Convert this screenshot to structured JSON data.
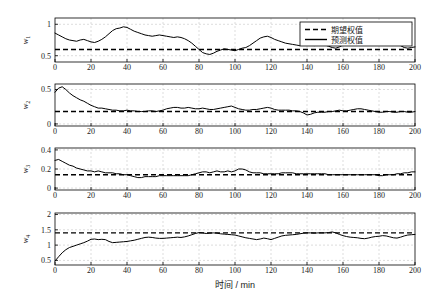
{
  "chart_data": {
    "type": "line",
    "title": "",
    "xlabel": "时间 / min",
    "xlim": [
      0,
      200
    ],
    "xticks": [
      0,
      20,
      40,
      60,
      80,
      100,
      120,
      140,
      160,
      180,
      200
    ],
    "grid": true,
    "legend_position": "top-right",
    "legend": [
      {
        "label": "期望权值",
        "style": "dashed"
      },
      {
        "label": "预测权值",
        "style": "solid"
      }
    ],
    "panels": [
      {
        "ylabel": "w1",
        "ylabel_base": "w",
        "ylabel_sub": "1",
        "ylim": [
          0.4,
          1.1
        ],
        "yticks": [
          0.5,
          1
        ],
        "ytick_labels": [
          "0.5",
          "1"
        ],
        "expected_value": 0.6,
        "series": [
          {
            "name": "预测权值",
            "x": [
              0,
              2,
              4,
              6,
              8,
              10,
              12,
              14,
              16,
              18,
              20,
              22,
              24,
              26,
              28,
              30,
              32,
              34,
              36,
              38,
              40,
              42,
              44,
              46,
              48,
              50,
              52,
              54,
              56,
              58,
              60,
              62,
              64,
              66,
              68,
              70,
              72,
              74,
              76,
              78,
              80,
              82,
              84,
              86,
              88,
              90,
              92,
              94,
              96,
              98,
              100,
              102,
              104,
              106,
              108,
              110,
              112,
              114,
              116,
              118,
              120,
              122,
              124,
              126,
              128,
              130,
              132,
              134,
              136,
              138,
              140,
              142,
              144,
              146,
              148,
              150,
              152,
              154,
              156,
              158,
              160,
              162,
              164,
              166,
              168,
              170,
              172,
              174,
              176,
              178,
              180,
              182,
              184,
              186,
              188,
              190,
              192,
              194,
              196,
              198,
              200
            ],
            "values": [
              0.86,
              0.83,
              0.8,
              0.77,
              0.75,
              0.74,
              0.73,
              0.75,
              0.76,
              0.74,
              0.72,
              0.71,
              0.73,
              0.76,
              0.8,
              0.85,
              0.9,
              0.93,
              0.94,
              0.96,
              0.95,
              0.92,
              0.89,
              0.87,
              0.85,
              0.83,
              0.82,
              0.81,
              0.82,
              0.83,
              0.82,
              0.81,
              0.8,
              0.79,
              0.8,
              0.79,
              0.77,
              0.74,
              0.7,
              0.65,
              0.6,
              0.55,
              0.53,
              0.52,
              0.54,
              0.57,
              0.59,
              0.61,
              0.6,
              0.59,
              0.58,
              0.6,
              0.62,
              0.63,
              0.66,
              0.7,
              0.74,
              0.78,
              0.8,
              0.81,
              0.79,
              0.76,
              0.74,
              0.72,
              0.7,
              0.69,
              0.68,
              0.67,
              0.66,
              0.67,
              0.68,
              0.67,
              0.66,
              0.67,
              0.68,
              0.67,
              0.65,
              0.63,
              0.62,
              0.64,
              0.67,
              0.7,
              0.72,
              0.73,
              0.74,
              0.75,
              0.76,
              0.75,
              0.74,
              0.73,
              0.72,
              0.71,
              0.72,
              0.74,
              0.73,
              0.7,
              0.66,
              0.63,
              0.62,
              0.63,
              0.64
            ]
          }
        ]
      },
      {
        "ylabel": "w2",
        "ylabel_base": "w",
        "ylabel_sub": "2",
        "ylim": [
          -0.03,
          0.58
        ],
        "yticks": [
          0,
          0.5
        ],
        "ytick_labels": [
          "0",
          "0.5"
        ],
        "expected_value": 0.18,
        "series": [
          {
            "name": "预测权值",
            "x": [
              0,
              2,
              4,
              6,
              8,
              10,
              12,
              14,
              16,
              18,
              20,
              22,
              24,
              26,
              28,
              30,
              32,
              34,
              36,
              38,
              40,
              42,
              44,
              46,
              48,
              50,
              52,
              54,
              56,
              58,
              60,
              62,
              64,
              66,
              68,
              70,
              72,
              74,
              76,
              78,
              80,
              82,
              84,
              86,
              88,
              90,
              92,
              94,
              96,
              98,
              100,
              102,
              104,
              106,
              108,
              110,
              112,
              114,
              116,
              118,
              120,
              122,
              124,
              126,
              128,
              130,
              132,
              134,
              136,
              138,
              140,
              142,
              144,
              146,
              148,
              150,
              152,
              154,
              156,
              158,
              160,
              162,
              164,
              166,
              168,
              170,
              172,
              174,
              176,
              178,
              180,
              182,
              184,
              186,
              188,
              190,
              192,
              194,
              196,
              198,
              200
            ],
            "values": [
              0.46,
              0.52,
              0.54,
              0.5,
              0.45,
              0.41,
              0.38,
              0.35,
              0.33,
              0.3,
              0.27,
              0.25,
              0.23,
              0.23,
              0.22,
              0.21,
              0.2,
              0.2,
              0.19,
              0.19,
              0.2,
              0.19,
              0.19,
              0.18,
              0.18,
              0.18,
              0.19,
              0.19,
              0.18,
              0.19,
              0.2,
              0.22,
              0.23,
              0.24,
              0.24,
              0.23,
              0.23,
              0.24,
              0.23,
              0.22,
              0.22,
              0.23,
              0.22,
              0.21,
              0.21,
              0.22,
              0.23,
              0.24,
              0.25,
              0.26,
              0.24,
              0.22,
              0.21,
              0.2,
              0.2,
              0.21,
              0.21,
              0.22,
              0.23,
              0.24,
              0.23,
              0.21,
              0.2,
              0.2,
              0.2,
              0.2,
              0.19,
              0.19,
              0.18,
              0.16,
              0.13,
              0.14,
              0.16,
              0.17,
              0.17,
              0.17,
              0.18,
              0.18,
              0.19,
              0.2,
              0.19,
              0.19,
              0.2,
              0.21,
              0.22,
              0.22,
              0.21,
              0.2,
              0.19,
              0.18,
              0.17,
              0.17,
              0.18,
              0.18,
              0.17,
              0.17,
              0.18,
              0.18,
              0.17,
              0.17,
              0.18
            ]
          }
        ]
      },
      {
        "ylabel": "w3",
        "ylabel_base": "w",
        "ylabel_sub": "3",
        "ylim": [
          -0.02,
          0.42
        ],
        "yticks": [
          0,
          0.2,
          0.4
        ],
        "ytick_labels": [
          "0",
          "0.2",
          "0.4"
        ],
        "expected_value": 0.14,
        "series": [
          {
            "name": "预测权值",
            "x": [
              0,
              2,
              4,
              6,
              8,
              10,
              12,
              14,
              16,
              18,
              20,
              22,
              24,
              26,
              28,
              30,
              32,
              34,
              36,
              38,
              40,
              42,
              44,
              46,
              48,
              50,
              52,
              54,
              56,
              58,
              60,
              62,
              64,
              66,
              68,
              70,
              72,
              74,
              76,
              78,
              80,
              82,
              84,
              86,
              88,
              90,
              92,
              94,
              96,
              98,
              100,
              102,
              104,
              106,
              108,
              110,
              112,
              114,
              116,
              118,
              120,
              122,
              124,
              126,
              128,
              130,
              132,
              134,
              136,
              138,
              140,
              142,
              144,
              146,
              148,
              150,
              152,
              154,
              156,
              158,
              160,
              162,
              164,
              166,
              168,
              170,
              172,
              174,
              176,
              178,
              180,
              182,
              184,
              186,
              188,
              190,
              192,
              194,
              196,
              198,
              200
            ],
            "values": [
              0.29,
              0.3,
              0.28,
              0.26,
              0.24,
              0.23,
              0.21,
              0.2,
              0.19,
              0.18,
              0.18,
              0.17,
              0.18,
              0.17,
              0.16,
              0.16,
              0.16,
              0.15,
              0.15,
              0.14,
              0.14,
              0.13,
              0.12,
              0.11,
              0.11,
              0.12,
              0.12,
              0.12,
              0.12,
              0.13,
              0.13,
              0.13,
              0.13,
              0.13,
              0.13,
              0.13,
              0.13,
              0.13,
              0.14,
              0.15,
              0.16,
              0.17,
              0.17,
              0.16,
              0.17,
              0.18,
              0.17,
              0.17,
              0.18,
              0.17,
              0.18,
              0.2,
              0.2,
              0.19,
              0.17,
              0.16,
              0.16,
              0.16,
              0.15,
              0.15,
              0.15,
              0.15,
              0.15,
              0.16,
              0.16,
              0.16,
              0.16,
              0.15,
              0.15,
              0.15,
              0.15,
              0.15,
              0.15,
              0.15,
              0.15,
              0.15,
              0.14,
              0.14,
              0.14,
              0.14,
              0.14,
              0.14,
              0.14,
              0.14,
              0.14,
              0.14,
              0.14,
              0.14,
              0.14,
              0.14,
              0.13,
              0.13,
              0.14,
              0.14,
              0.14,
              0.15,
              0.15,
              0.16,
              0.16,
              0.17,
              0.17
            ]
          }
        ]
      },
      {
        "ylabel": "w4",
        "ylabel_base": "w",
        "ylabel_sub": "4",
        "ylim": [
          0.35,
          2.05
        ],
        "yticks": [
          0.5,
          1,
          1.5,
          2
        ],
        "ytick_labels": [
          "0.5",
          "1",
          "1.5",
          "2"
        ],
        "expected_value": 1.4,
        "series": [
          {
            "name": "预测权值",
            "x": [
              0,
              2,
              4,
              6,
              8,
              10,
              12,
              14,
              16,
              18,
              20,
              22,
              24,
              26,
              28,
              30,
              32,
              34,
              36,
              38,
              40,
              42,
              44,
              46,
              48,
              50,
              52,
              54,
              56,
              58,
              60,
              62,
              64,
              66,
              68,
              70,
              72,
              74,
              76,
              78,
              80,
              82,
              84,
              86,
              88,
              90,
              92,
              94,
              96,
              98,
              100,
              102,
              104,
              106,
              108,
              110,
              112,
              114,
              116,
              118,
              120,
              122,
              124,
              126,
              128,
              130,
              132,
              134,
              136,
              138,
              140,
              142,
              144,
              146,
              148,
              150,
              152,
              154,
              156,
              158,
              160,
              162,
              164,
              166,
              168,
              170,
              172,
              174,
              176,
              178,
              180,
              182,
              184,
              186,
              188,
              190,
              192,
              194,
              196,
              198,
              200
            ],
            "values": [
              0.48,
              0.62,
              0.75,
              0.85,
              0.92,
              0.96,
              1.0,
              1.04,
              1.08,
              1.13,
              1.19,
              1.2,
              1.18,
              1.19,
              1.18,
              1.12,
              1.08,
              1.09,
              1.1,
              1.11,
              1.12,
              1.14,
              1.16,
              1.19,
              1.22,
              1.25,
              1.26,
              1.25,
              1.23,
              1.22,
              1.22,
              1.23,
              1.24,
              1.25,
              1.26,
              1.25,
              1.27,
              1.3,
              1.34,
              1.38,
              1.41,
              1.4,
              1.38,
              1.39,
              1.4,
              1.39,
              1.37,
              1.36,
              1.35,
              1.34,
              1.33,
              1.3,
              1.27,
              1.24,
              1.22,
              1.2,
              1.18,
              1.2,
              1.23,
              1.21,
              1.18,
              1.22,
              1.26,
              1.3,
              1.32,
              1.33,
              1.34,
              1.35,
              1.37,
              1.39,
              1.4,
              1.4,
              1.39,
              1.4,
              1.4,
              1.4,
              1.41,
              1.43,
              1.4,
              1.35,
              1.31,
              1.28,
              1.26,
              1.25,
              1.24,
              1.22,
              1.21,
              1.23,
              1.26,
              1.28,
              1.29,
              1.31,
              1.3,
              1.27,
              1.24,
              1.23,
              1.26,
              1.3,
              1.33,
              1.34,
              1.35
            ]
          }
        ]
      }
    ],
    "colors": {
      "line": "#000000",
      "expected_line": "#000000",
      "grid": "#b8b8b8",
      "axis": "#000000",
      "background": "#ffffff"
    }
  }
}
